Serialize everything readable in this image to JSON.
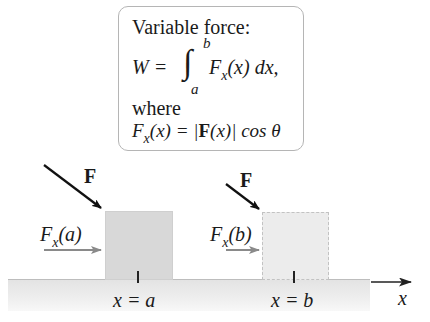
{
  "infobox": {
    "title": "Variable force:",
    "work_lhs": "W =",
    "integral_symbol": "∫",
    "lower_limit": "a",
    "upper_limit": "b",
    "integrand_F": "F",
    "integrand_sub": "x",
    "integrand_arg": "(x) dx,",
    "where": "where",
    "def_F": "F",
    "def_sub": "x",
    "def_arg": "(x) = |",
    "def_boldF": "F",
    "def_rest": "(x)| cos θ"
  },
  "scene": {
    "block_a": {
      "force_label": "F",
      "component_label_F": "F",
      "component_label_sub": "x",
      "component_label_arg": "(a)",
      "position_label": "x = a"
    },
    "block_b": {
      "force_label": "F",
      "component_label_F": "F",
      "component_label_sub": "x",
      "component_label_arg": "(b)",
      "position_label": "x = b"
    },
    "axis_label": "x"
  },
  "colors": {
    "force_arrow": "#111111",
    "component_arrow": "#8a8a8a",
    "block_a_fill": "#d8d8d8",
    "block_b_fill": "#ececec",
    "ground": "#e6e6e6"
  }
}
